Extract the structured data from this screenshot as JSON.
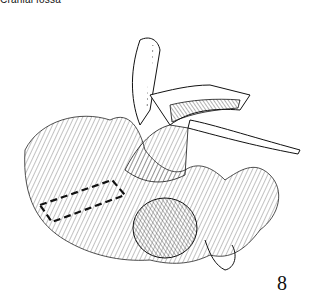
{
  "caption": "Cranial fossa",
  "figure": {
    "number": "8"
  },
  "colors": {
    "ink": "#111111",
    "paper": "#ffffff"
  }
}
